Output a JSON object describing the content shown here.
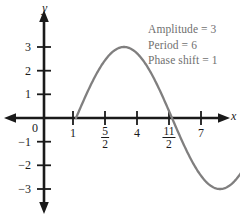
{
  "figure": {
    "title": "",
    "background_color": "#ffffff"
  },
  "annotations": {
    "amplitude": "Amplitude = 3",
    "period": "Period = 6",
    "phase_shift": "Phase shift = 1",
    "color": "#6f6f6f"
  },
  "axes": {
    "x_label": "x",
    "y_label": "y",
    "origin_label": "0",
    "axis_color": "#1a1a1a",
    "x_ticks": [
      {
        "label": "1",
        "value": 1,
        "fraction": false
      },
      {
        "label": "5/2",
        "value": 2.5,
        "fraction": true,
        "numerator": "5",
        "denominator": "2"
      },
      {
        "label": "4",
        "value": 4,
        "fraction": false
      },
      {
        "label": "11/2",
        "value": 5.5,
        "fraction": true,
        "numerator": "11",
        "denominator": "2"
      },
      {
        "label": "7",
        "value": 7,
        "fraction": false
      }
    ],
    "y_ticks": [
      {
        "label": "3",
        "value": 3
      },
      {
        "label": "2",
        "value": 2
      },
      {
        "label": "1",
        "value": 1
      },
      {
        "label": "−1",
        "value": -1
      },
      {
        "label": "−2",
        "value": -2
      },
      {
        "label": "−3",
        "value": -3
      }
    ],
    "xlim": [
      -2.3,
      8.8
    ],
    "ylim": [
      -4.6,
      4.2
    ]
  },
  "chart_data": {
    "type": "line",
    "title": "",
    "xlabel": "x",
    "ylabel": "y",
    "grid": false,
    "legend": null,
    "xlim": [
      -2.3,
      8.8
    ],
    "ylim": [
      -4.6,
      4.2
    ],
    "annotations": [
      "Amplitude = 3",
      "Period = 6",
      "Phase shift = 1"
    ],
    "series": [
      {
        "name": "y = 3 sin(pi/3 (x - 1))",
        "color": "#807f7f",
        "amplitude": 3,
        "period": 6,
        "phase_shift": 1,
        "x_domain": [
          1,
          7
        ],
        "x": [
          1,
          1.25,
          1.5,
          1.75,
          2,
          2.25,
          2.5,
          2.75,
          3,
          3.25,
          3.5,
          3.75,
          4,
          4.25,
          4.5,
          4.75,
          5,
          5.25,
          5.5,
          5.75,
          6,
          6.25,
          6.5,
          6.75,
          7
        ],
        "y": [
          0,
          0.776,
          1.5,
          2.121,
          2.598,
          2.898,
          3,
          2.898,
          2.598,
          2.121,
          1.5,
          0.776,
          0,
          -0.776,
          -1.5,
          -2.121,
          -2.598,
          -2.898,
          -3,
          -2.898,
          -2.598,
          -2.121,
          -1.5,
          -0.776,
          0
        ],
        "key_points": [
          {
            "x": 1,
            "y": 0,
            "kind": "zero-ascending"
          },
          {
            "x": 2.5,
            "y": 3,
            "kind": "maximum"
          },
          {
            "x": 4,
            "y": 0,
            "kind": "zero-descending"
          },
          {
            "x": 5.5,
            "y": -3,
            "kind": "minimum"
          },
          {
            "x": 7,
            "y": 0,
            "kind": "zero-ascending"
          }
        ]
      }
    ]
  }
}
